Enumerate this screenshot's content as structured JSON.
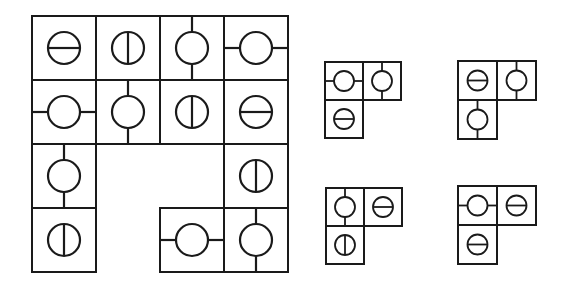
{
  "puzzle": {
    "stroke_color": "#1a1a1a",
    "background_color": "#ffffff",
    "cell_types": {
      "h-bar": "circle with horizontal line inside",
      "v-bar": "circle with vertical line inside",
      "v-conn": "circle with vertical connectors to top and bottom edges",
      "h-conn": "circle with horizontal connectors to left and right edges"
    },
    "main_grid": {
      "x": 31,
      "y": 15,
      "cell": 66,
      "radius": 16,
      "cells": [
        {
          "row": 0,
          "col": 0,
          "type": "h-bar"
        },
        {
          "row": 0,
          "col": 1,
          "type": "v-bar"
        },
        {
          "row": 0,
          "col": 2,
          "type": "v-conn"
        },
        {
          "row": 0,
          "col": 3,
          "type": "h-conn"
        },
        {
          "row": 1,
          "col": 0,
          "type": "h-conn"
        },
        {
          "row": 1,
          "col": 1,
          "type": "v-conn"
        },
        {
          "row": 1,
          "col": 2,
          "type": "v-bar"
        },
        {
          "row": 1,
          "col": 3,
          "type": "h-bar"
        },
        {
          "row": 2,
          "col": 0,
          "type": "v-conn"
        },
        {
          "row": 2,
          "col": 3,
          "type": "v-bar"
        },
        {
          "row": 3,
          "col": 0,
          "type": "v-bar"
        },
        {
          "row": 3,
          "col": 2,
          "type": "h-conn"
        },
        {
          "row": 3,
          "col": 3,
          "type": "v-conn"
        }
      ]
    },
    "options": [
      {
        "id": "option-a",
        "x": 324,
        "y": 61,
        "cell": 40,
        "radius": 10,
        "cells": [
          {
            "row": 0,
            "col": 0,
            "type": "h-conn"
          },
          {
            "row": 0,
            "col": 1,
            "type": "v-conn"
          },
          {
            "row": 1,
            "col": 0,
            "type": "h-bar"
          }
        ]
      },
      {
        "id": "option-b",
        "x": 457,
        "y": 60,
        "cell": 41,
        "radius": 10,
        "cells": [
          {
            "row": 0,
            "col": 0,
            "type": "h-bar"
          },
          {
            "row": 0,
            "col": 1,
            "type": "v-conn"
          },
          {
            "row": 1,
            "col": 0,
            "type": "v-conn"
          }
        ]
      },
      {
        "id": "option-c",
        "x": 325,
        "y": 187,
        "cell": 40,
        "radius": 10,
        "cells": [
          {
            "row": 0,
            "col": 0,
            "type": "v-conn"
          },
          {
            "row": 0,
            "col": 1,
            "type": "h-bar"
          },
          {
            "row": 1,
            "col": 0,
            "type": "v-bar"
          }
        ]
      },
      {
        "id": "option-d",
        "x": 457,
        "y": 185,
        "cell": 41,
        "radius": 10,
        "cells": [
          {
            "row": 0,
            "col": 0,
            "type": "h-conn"
          },
          {
            "row": 0,
            "col": 1,
            "type": "h-bar"
          },
          {
            "row": 1,
            "col": 0,
            "type": "h-bar"
          }
        ]
      }
    ]
  }
}
